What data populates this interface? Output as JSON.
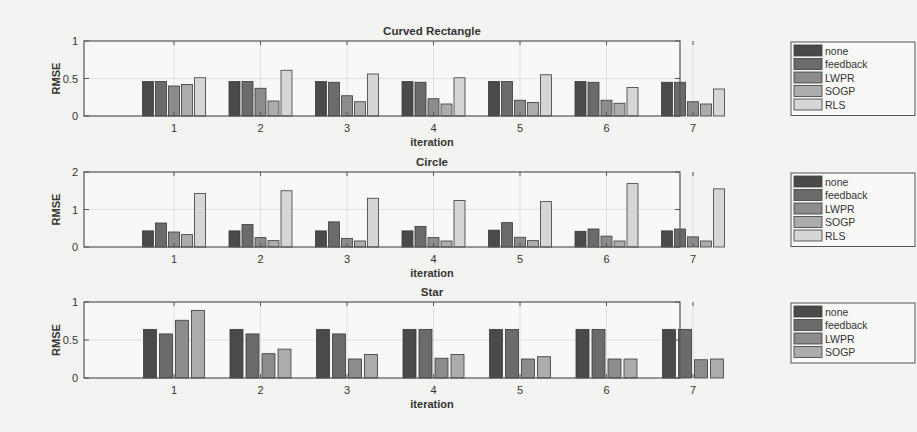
{
  "figure": {
    "colors": {
      "none": "#4a4a4a",
      "feedback": "#6b6b6b",
      "LWPR": "#8c8c8c",
      "SOGP": "#acacac",
      "RLS": "#d6d6d6",
      "axes_bg": "#f8f8f7",
      "grid": "#d9d9d9",
      "axis": "#555555"
    }
  },
  "chart_data": [
    {
      "type": "bar",
      "title": "Curved Rectangle",
      "xlabel": "iteration",
      "ylabel": "RMSE",
      "ylim": [
        0,
        1
      ],
      "yticks": [
        "0",
        "0.5",
        "1"
      ],
      "grid": true,
      "legend_position": "right",
      "categories": [
        "1",
        "2",
        "3",
        "4",
        "5",
        "6",
        "7"
      ],
      "series": [
        {
          "name": "none",
          "values": [
            0.46,
            0.46,
            0.46,
            0.46,
            0.46,
            0.46,
            0.45
          ]
        },
        {
          "name": "feedback",
          "values": [
            0.46,
            0.46,
            0.45,
            0.45,
            0.46,
            0.45,
            0.45
          ]
        },
        {
          "name": "LWPR",
          "values": [
            0.4,
            0.37,
            0.27,
            0.23,
            0.21,
            0.21,
            0.19
          ]
        },
        {
          "name": "SOGP",
          "values": [
            0.42,
            0.2,
            0.19,
            0.16,
            0.18,
            0.17,
            0.16
          ]
        },
        {
          "name": "RLS",
          "values": [
            0.51,
            0.61,
            0.56,
            0.51,
            0.55,
            0.38,
            0.36
          ]
        }
      ]
    },
    {
      "type": "bar",
      "title": "Circle",
      "xlabel": "iteration",
      "ylabel": "RMSE",
      "ylim": [
        0,
        2
      ],
      "yticks": [
        "0",
        "1",
        "2"
      ],
      "grid": true,
      "legend_position": "right",
      "categories": [
        "1",
        "2",
        "3",
        "4",
        "5",
        "6",
        "7"
      ],
      "series": [
        {
          "name": "none",
          "values": [
            0.43,
            0.43,
            0.43,
            0.43,
            0.45,
            0.42,
            0.43
          ]
        },
        {
          "name": "feedback",
          "values": [
            0.64,
            0.6,
            0.67,
            0.55,
            0.65,
            0.48,
            0.48
          ]
        },
        {
          "name": "LWPR",
          "values": [
            0.4,
            0.25,
            0.23,
            0.25,
            0.26,
            0.29,
            0.27
          ]
        },
        {
          "name": "SOGP",
          "values": [
            0.33,
            0.17,
            0.16,
            0.16,
            0.17,
            0.16,
            0.16
          ]
        },
        {
          "name": "RLS",
          "values": [
            1.43,
            1.5,
            1.3,
            1.24,
            1.21,
            1.69,
            1.55
          ]
        }
      ]
    },
    {
      "type": "bar",
      "title": "Star",
      "xlabel": "iteration",
      "ylabel": "RMSE",
      "ylim": [
        0,
        1
      ],
      "yticks": [
        "0",
        "0.5",
        "1"
      ],
      "grid": true,
      "legend_position": "right",
      "categories": [
        "1",
        "2",
        "3",
        "4",
        "5",
        "6",
        "7"
      ],
      "series": [
        {
          "name": "none",
          "values": [
            0.64,
            0.64,
            0.64,
            0.64,
            0.64,
            0.64,
            0.64
          ]
        },
        {
          "name": "feedback",
          "values": [
            0.58,
            0.58,
            0.58,
            0.64,
            0.64,
            0.64,
            0.64
          ]
        },
        {
          "name": "LWPR",
          "values": [
            0.76,
            0.32,
            0.25,
            0.26,
            0.25,
            0.25,
            0.24
          ]
        },
        {
          "name": "SOGP",
          "values": [
            0.89,
            0.38,
            0.31,
            0.31,
            0.28,
            0.25,
            0.25
          ]
        }
      ]
    }
  ]
}
